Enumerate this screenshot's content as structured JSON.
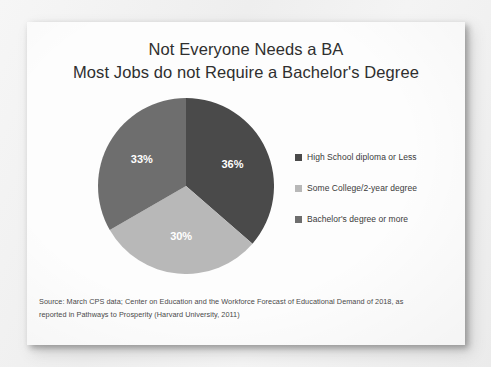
{
  "slide": {
    "title_line_1": "Not Everyone Needs a BA",
    "title_line_2": "Most Jobs do not Require a Bachelor's Degree",
    "source_line_1": "Source: March CPS data; Center on Education and the Workforce Forecast of Educational Demand of 2018, as",
    "source_line_2": "reported in Pathways to Prosperity (Harvard University, 2011)"
  },
  "legend": {
    "position": "right",
    "items": [
      {
        "label": "High School diploma or Less",
        "color": "#4a4a4a"
      },
      {
        "label": "Some College/2-year degree",
        "color": "#b8b8b8"
      },
      {
        "label": "Bachelor's degree or more",
        "color": "#6e6e6e"
      }
    ]
  },
  "chart_data": {
    "type": "pie",
    "xlabel": "",
    "ylabel": "",
    "legend_position": "right",
    "grid": false,
    "categories": [
      "High School diploma or Less",
      "Some College/2-year degree",
      "Bachelor's degree or more"
    ],
    "values": [
      36,
      30,
      33
    ],
    "value_labels": [
      "36%",
      "30%",
      "33%"
    ],
    "colors": [
      "#4a4a4a",
      "#b8b8b8",
      "#6e6e6e"
    ],
    "units": "percent",
    "start_angle_deg": 0,
    "direction": "clockwise",
    "slices": [
      {
        "label": "High School diploma or Less",
        "value": 36,
        "display": "36%",
        "color": "#4a4a4a"
      },
      {
        "label": "Some College/2-year degree",
        "value": 30,
        "display": "30%",
        "color": "#b8b8b8"
      },
      {
        "label": "Bachelor's degree or more",
        "value": 33,
        "display": "33%",
        "color": "#6e6e6e"
      }
    ]
  }
}
